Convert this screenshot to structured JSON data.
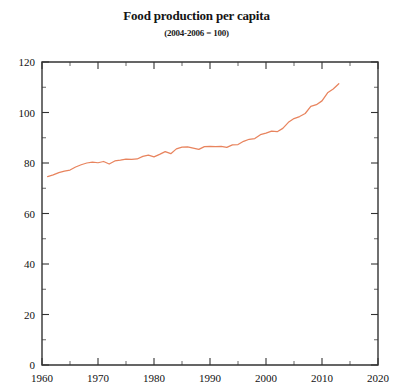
{
  "chart_data": {
    "type": "line",
    "title": "Food production per capita",
    "subtitle": "(2004-2006 = 100)",
    "xlabel": "",
    "ylabel": "",
    "xlim": [
      1960,
      2020
    ],
    "ylim": [
      0,
      120
    ],
    "grid": false,
    "legend": "none",
    "line_color": "#e8845e",
    "axis_color": "#333333",
    "background": "#ffffff",
    "x_ticks": [
      1960,
      1970,
      1980,
      1990,
      2000,
      2010,
      2020
    ],
    "x_tick_labels": [
      "1960",
      "1970",
      "1980",
      "1990",
      "2000",
      "2010",
      "2020"
    ],
    "x_minor_tick_interval": 5,
    "y_ticks": [
      0,
      20,
      40,
      60,
      80,
      100,
      120
    ],
    "y_tick_labels": [
      "0",
      "20",
      "40",
      "60",
      "80",
      "100",
      "120"
    ],
    "y_minor_tick_interval": 10,
    "series": [
      {
        "name": "Food production per capita",
        "color": "#e8845e",
        "x": [
          1961,
          1962,
          1963,
          1964,
          1965,
          1966,
          1967,
          1968,
          1969,
          1970,
          1971,
          1972,
          1973,
          1974,
          1975,
          1976,
          1977,
          1978,
          1979,
          1980,
          1981,
          1982,
          1983,
          1984,
          1985,
          1986,
          1987,
          1988,
          1989,
          1990,
          1991,
          1992,
          1993,
          1994,
          1995,
          1996,
          1997,
          1998,
          1999,
          2000,
          2001,
          2002,
          2003,
          2004,
          2005,
          2006,
          2007,
          2008,
          2009,
          2010,
          2011,
          2012,
          2013
        ],
        "values": [
          74.6,
          75.3,
          76.2,
          76.8,
          77.2,
          78.4,
          79.3,
          80.0,
          80.3,
          80.1,
          80.6,
          79.6,
          80.8,
          81.1,
          81.5,
          81.4,
          81.6,
          82.6,
          83.1,
          82.4,
          83.4,
          84.5,
          83.7,
          85.6,
          86.3,
          86.4,
          85.9,
          85.4,
          86.5,
          86.6,
          86.5,
          86.6,
          86.2,
          87.2,
          87.3,
          88.6,
          89.4,
          89.7,
          91.2,
          91.8,
          92.6,
          92.4,
          93.7,
          96.1,
          97.6,
          98.4,
          99.6,
          102.4,
          103.1,
          104.6,
          107.8,
          109.3,
          111.4
        ]
      }
    ]
  },
  "plot_geometry": {
    "left": 42,
    "right": 378,
    "top": 62,
    "bottom": 365
  }
}
